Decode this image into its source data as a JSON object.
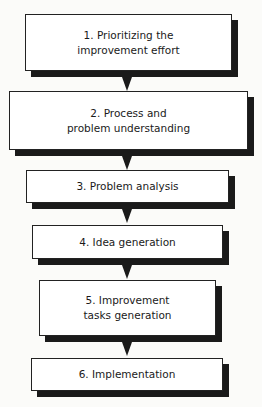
{
  "diagram": {
    "type": "flowchart",
    "direction": "top-to-bottom",
    "steps": [
      {
        "label": "1. Prioritizing the\nimprovement effort"
      },
      {
        "label": "2. Process and\nproblem understanding"
      },
      {
        "label": "3. Problem analysis"
      },
      {
        "label": "4. Idea generation"
      },
      {
        "label": "5. Improvement\ntasks generation"
      },
      {
        "label": "6. Implementation"
      }
    ],
    "connectors": [
      {
        "from": 1,
        "to": 2
      },
      {
        "from": 2,
        "to": 3
      },
      {
        "from": 3,
        "to": 4
      },
      {
        "from": 4,
        "to": 5
      },
      {
        "from": 5,
        "to": 6
      }
    ],
    "colors": {
      "box_fill": "#ffffff",
      "box_border": "#222222",
      "shadow": "#1a1a1a",
      "arrow": "#1a1a1a",
      "background": "#fbfbf9"
    }
  }
}
